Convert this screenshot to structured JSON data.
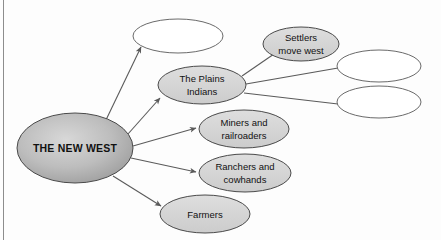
{
  "diagram": {
    "type": "concept-map",
    "title": "The New West",
    "center_node": {
      "id": "the-new-west",
      "label": "THE NEW WEST",
      "shape": "ellipse",
      "fill": "#b6b6b6",
      "cx": 75,
      "cy": 148,
      "rx": 58,
      "ry": 35
    },
    "branch_nodes": [
      {
        "id": "blank-top-left",
        "lines": [],
        "blank": true,
        "shape": "ellipse",
        "fill": "#ffffff",
        "cx": 178,
        "cy": 36,
        "rx": 45,
        "ry": 17
      },
      {
        "id": "the-plains-indians",
        "lines": [
          "The Plains",
          "Indians"
        ],
        "blank": false,
        "shape": "ellipse",
        "fill": "#d4d4d4",
        "cx": 202,
        "cy": 85,
        "rx": 44,
        "ry": 19
      },
      {
        "id": "miners-and-railroaders",
        "lines": [
          "Miners and",
          "railroaders"
        ],
        "blank": false,
        "shape": "ellipse",
        "fill": "#d4d4d4",
        "cx": 244,
        "cy": 129,
        "rx": 45,
        "ry": 19
      },
      {
        "id": "ranchers-and-cowhands",
        "lines": [
          "Ranchers and",
          "cowhands"
        ],
        "blank": false,
        "shape": "ellipse",
        "fill": "#d4d4d4",
        "cx": 245,
        "cy": 173,
        "rx": 46,
        "ry": 19
      },
      {
        "id": "farmers",
        "lines": [
          "Farmers"
        ],
        "blank": false,
        "shape": "ellipse",
        "fill": "#d4d4d4",
        "cx": 205,
        "cy": 214,
        "rx": 45,
        "ry": 19
      },
      {
        "id": "settlers-move-west",
        "lines": [
          "Settlers",
          "move west"
        ],
        "blank": false,
        "shape": "ellipse",
        "fill": "#d4d4d4",
        "cx": 301,
        "cy": 44,
        "rx": 38,
        "ry": 17
      },
      {
        "id": "blank-right-upper",
        "lines": [],
        "blank": true,
        "shape": "ellipse",
        "fill": "#ffffff",
        "cx": 379,
        "cy": 66,
        "rx": 42,
        "ry": 16
      },
      {
        "id": "blank-right-lower",
        "lines": [],
        "blank": true,
        "shape": "ellipse",
        "fill": "#ffffff",
        "cx": 379,
        "cy": 102,
        "rx": 42,
        "ry": 16
      }
    ],
    "connectors": [
      {
        "id": "new-west-to-blank-top-left",
        "from": "the-new-west",
        "to": "blank-top-left",
        "arrow": true
      },
      {
        "id": "new-west-to-plains-indians",
        "from": "the-new-west",
        "to": "the-plains-indians",
        "arrow": true
      },
      {
        "id": "new-west-to-miners",
        "from": "the-new-west",
        "to": "miners-and-railroaders",
        "arrow": true
      },
      {
        "id": "new-west-to-ranchers",
        "from": "the-new-west",
        "to": "ranchers-and-cowhands",
        "arrow": true
      },
      {
        "id": "new-west-to-farmers",
        "from": "the-new-west",
        "to": "farmers",
        "arrow": true
      },
      {
        "id": "plains-indians-to-settlers",
        "from": "the-plains-indians",
        "to": "settlers-move-west",
        "arrow": false
      },
      {
        "id": "plains-indians-to-blank-right-upper",
        "from": "the-plains-indians",
        "to": "blank-right-upper",
        "arrow": false
      },
      {
        "id": "plains-indians-to-blank-right-lower",
        "from": "the-plains-indians",
        "to": "blank-right-lower",
        "arrow": false
      }
    ]
  },
  "colors": {
    "center_fill": "#b6b6b6",
    "branch_fill": "#d4d4d4",
    "blank_fill": "#ffffff",
    "outline": "#4a4a4a",
    "connector": "#5a5a5a",
    "text": "#111111",
    "page_background": "#fdfdfd",
    "rule": "#8d8d8d"
  }
}
